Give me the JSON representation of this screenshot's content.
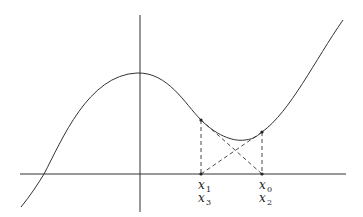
{
  "diagram": {
    "title": "",
    "labels": [
      {
        "id": "x1",
        "base": "x",
        "sub": "1"
      },
      {
        "id": "x3",
        "base": "x",
        "sub": "3"
      },
      {
        "id": "x0",
        "base": "x",
        "sub": "0"
      },
      {
        "id": "x2",
        "base": "x",
        "sub": "2"
      }
    ],
    "line_color": "#333333"
  }
}
